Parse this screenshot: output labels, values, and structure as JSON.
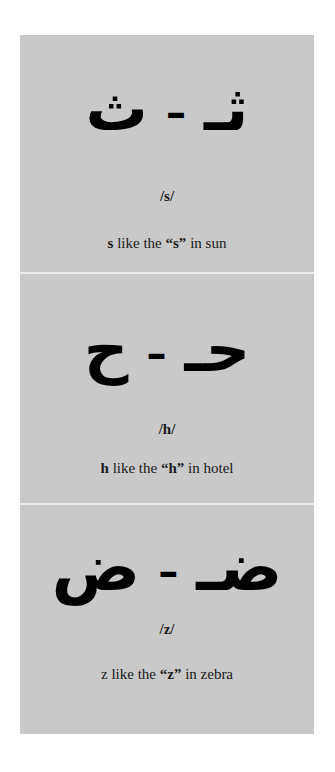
{
  "colors": {
    "page_background": "#ffffff",
    "card_background": "#c9c9c9",
    "separator": "#ececec",
    "text": "#000000"
  },
  "cards": [
    {
      "initial_form": "ثـ",
      "dash": "–",
      "isolated_form": "ث",
      "ipa": "/s/",
      "example": {
        "lead": "s",
        "middle": " like the ",
        "quoted": "“s”",
        "tail_pre": " in ",
        "tail_word": "sun"
      }
    },
    {
      "initial_form": "حـ",
      "dash": "–",
      "isolated_form": "ح",
      "ipa": "/h/",
      "example": {
        "lead": "h",
        "middle": " like the ",
        "quoted": "“h”",
        "tail_pre": " in ",
        "tail_word": "hotel"
      }
    },
    {
      "initial_form": "ضـ",
      "dash": "–",
      "isolated_form": "ض",
      "ipa": "/z/",
      "example": {
        "lead": "z",
        "middle": " like the ",
        "quoted": "“z”",
        "tail_pre": " in ",
        "tail_word": "zebra"
      }
    }
  ]
}
